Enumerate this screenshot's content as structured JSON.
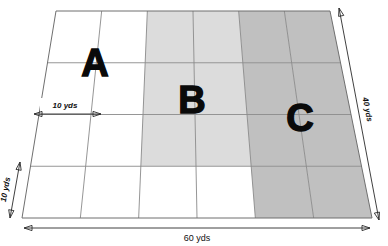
{
  "figure": {
    "regions": [
      {
        "id": "A",
        "label": "A",
        "fill": "#ffffff",
        "description": "unshaded region"
      },
      {
        "id": "B",
        "label": "B",
        "fill": "#dcdcdc",
        "description": "light grey shaded region"
      },
      {
        "id": "C",
        "label": "C",
        "fill": "#c0c0c0",
        "description": "darker grey shaded region"
      }
    ],
    "dimensions": {
      "bottom": "60 yds",
      "right": "40 yds",
      "cell_width": "10 yds",
      "cell_height": "10 yds"
    },
    "grid": {
      "columns": 6,
      "rows": 4,
      "cell_size_yds": 10,
      "total_width_yds": 60,
      "total_height_yds": 40,
      "shading_by_cell": [
        [
          "#ffffff",
          "#ffffff",
          "#dcdcdc",
          "#dcdcdc",
          "#c0c0c0",
          "#c0c0c0"
        ],
        [
          "#ffffff",
          "#ffffff",
          "#dcdcdc",
          "#dcdcdc",
          "#c0c0c0",
          "#c0c0c0"
        ],
        [
          "#ffffff",
          "#ffffff",
          "#dcdcdc",
          "#dcdcdc",
          "#c0c0c0",
          "#c0c0c0"
        ],
        [
          "#ffffff",
          "#ffffff",
          "#ffffff",
          "#ffffff",
          "#c0c0c0",
          "#c0c0c0"
        ]
      ]
    },
    "colors": {
      "region_a": "#ffffff",
      "region_b": "#dcdcdc",
      "region_c": "#c0c0c0",
      "grid_line": "#8a8a8a",
      "outline": "#6f6f6f",
      "text": "#111111",
      "background": "#ffffff"
    }
  }
}
